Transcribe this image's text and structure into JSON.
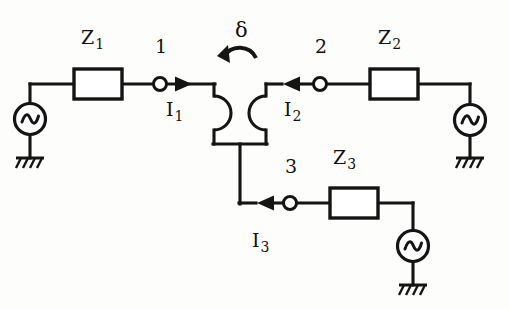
{
  "figure": {
    "background_color": "#fdfdfc",
    "ink_color": "#141414"
  },
  "labels": {
    "impedance_1": "Z",
    "impedance_1_sub": "1",
    "impedance_2": "Z",
    "impedance_2_sub": "2",
    "impedance_3": "Z",
    "impedance_3_sub": "3",
    "node_1": "1",
    "node_2": "2",
    "node_3": "3",
    "current_1": "I",
    "current_1_sub": "1",
    "current_2": "I",
    "current_2_sub": "2",
    "current_3": "I",
    "current_3_sub": "3",
    "rotation_angle": "δ"
  },
  "components": {
    "sources": [
      {
        "name": "ac-source-1",
        "symbol": "~",
        "branch": "left"
      },
      {
        "name": "ac-source-2",
        "symbol": "~",
        "branch": "right"
      },
      {
        "name": "ac-source-3",
        "symbol": "~",
        "branch": "bottom"
      }
    ],
    "impedances": [
      {
        "name": "impedance-box-z1",
        "label": "Z1",
        "branch": "left"
      },
      {
        "name": "impedance-box-z2",
        "label": "Z2",
        "branch": "right"
      },
      {
        "name": "impedance-box-z3",
        "label": "Z3",
        "branch": "bottom"
      }
    ],
    "terminals": [
      {
        "name": "terminal-node-1",
        "label": "1"
      },
      {
        "name": "terminal-node-2",
        "label": "2"
      },
      {
        "name": "terminal-node-3",
        "label": "3"
      }
    ],
    "grounds": [
      {
        "name": "ground-symbol-left",
        "style": "hatched"
      },
      {
        "name": "ground-symbol-right",
        "style": "hatched"
      },
      {
        "name": "ground-symbol-bottom",
        "style": "hatched"
      }
    ],
    "current_arrows": [
      {
        "name": "current-arrow-i1",
        "label": "I1",
        "direction": "right"
      },
      {
        "name": "current-arrow-i2",
        "label": "I2",
        "direction": "left"
      },
      {
        "name": "current-arrow-i3",
        "label": "I3",
        "direction": "left"
      }
    ],
    "wire_hops": [
      {
        "name": "wire-hop-left",
        "bulge": "right"
      },
      {
        "name": "wire-hop-right",
        "bulge": "left"
      }
    ],
    "rotation_marker": {
      "name": "rotation-arrow-delta",
      "label": "δ",
      "direction": "counter-clockwise"
    }
  }
}
